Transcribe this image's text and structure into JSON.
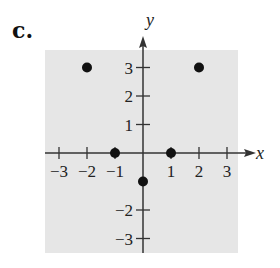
{
  "figure_label": "c.",
  "colors": {
    "plot_background": "#e6e6e6",
    "axis": "#333333",
    "point": "#111111",
    "text": "#222222"
  },
  "chart_data": {
    "type": "scatter",
    "title": "",
    "xlabel": "x",
    "ylabel": "y",
    "xlim": [
      -3.5,
      3.5
    ],
    "ylim": [
      -3.5,
      3.5
    ],
    "x_ticks": [
      -3,
      -2,
      -1,
      1,
      2,
      3
    ],
    "y_ticks": [
      3,
      2,
      1,
      -2,
      -3
    ],
    "x_tick_labels": [
      "−3",
      "−2",
      "−1",
      "1",
      "2",
      "3"
    ],
    "y_tick_labels": [
      "3",
      "2",
      "1",
      "−2",
      "−3"
    ],
    "grid": false,
    "legend": null,
    "series": [
      {
        "name": "points",
        "points": [
          {
            "x": -2,
            "y": 3
          },
          {
            "x": 2,
            "y": 3
          },
          {
            "x": -1,
            "y": 0
          },
          {
            "x": 1,
            "y": 0
          },
          {
            "x": 0,
            "y": -1
          }
        ]
      }
    ]
  }
}
